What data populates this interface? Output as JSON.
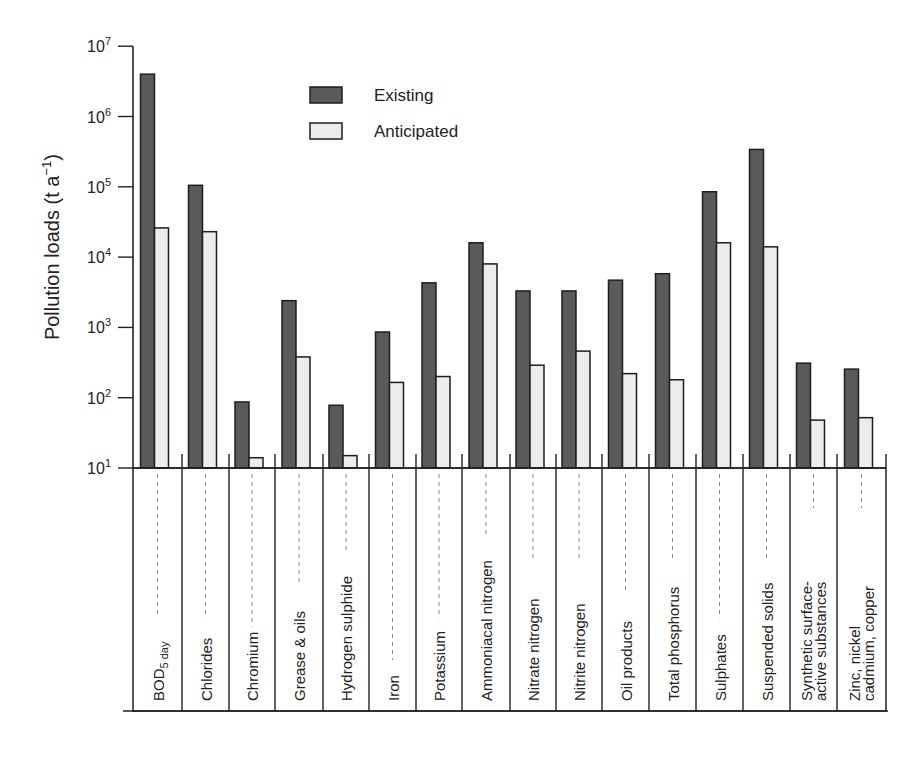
{
  "chart_data": {
    "type": "bar",
    "title": "",
    "xlabel": "",
    "ylabel": "Pollution loads  (t a⁻¹)",
    "ylabel_parts": {
      "main": "Pollution loads  (t a",
      "sup": "−1",
      "close": ")"
    },
    "yscale": "log",
    "ylim": [
      10,
      10000000
    ],
    "yticks": [
      {
        "base": "10",
        "exp": "1"
      },
      {
        "base": "10",
        "exp": "2"
      },
      {
        "base": "10",
        "exp": "3"
      },
      {
        "base": "10",
        "exp": "4"
      },
      {
        "base": "10",
        "exp": "5"
      },
      {
        "base": "10",
        "exp": "6"
      },
      {
        "base": "10",
        "exp": "7"
      }
    ],
    "grid": false,
    "legend_position": "upper-center",
    "categories": [
      [
        "BOD",
        "5 day"
      ],
      [
        "Chlorides"
      ],
      [
        "Chromium"
      ],
      [
        "Grease & oils"
      ],
      [
        "Hydrogen sulphide"
      ],
      [
        "Iron"
      ],
      [
        "Potassium"
      ],
      [
        "Ammoniacal nitrogen"
      ],
      [
        "Nitrate nitrogen"
      ],
      [
        "Nitrite nitrogen"
      ],
      [
        "Oil products"
      ],
      [
        "Total phosphorus"
      ],
      [
        "Sulphates"
      ],
      [
        "Suspended solids"
      ],
      [
        "Synthetic surface-",
        "active substances"
      ],
      [
        "Zinc, nickel",
        "cadmium, copper"
      ]
    ],
    "category_names": [
      "BOD5 day",
      "Chlorides",
      "Chromium",
      "Grease & oils",
      "Hydrogen sulphide",
      "Iron",
      "Potassium",
      "Ammoniacal nitrogen",
      "Nitrate nitrogen",
      "Nitrite nitrogen",
      "Oil products",
      "Total phosphorus",
      "Sulphates",
      "Suspended solids",
      "Synthetic surface-active substances",
      "Zinc, nickel cadmium, copper"
    ],
    "series": [
      {
        "name": "Existing",
        "color": "#5a5a5a",
        "values": [
          4000000,
          105000,
          87,
          2400,
          78,
          860,
          4300,
          16000,
          3300,
          3300,
          4700,
          5800,
          85000,
          340000,
          310,
          255
        ]
      },
      {
        "name": "Anticipated",
        "color": "#ececec",
        "values": [
          26000,
          23000,
          14,
          380,
          15,
          165,
          200,
          8000,
          290,
          460,
          220,
          180,
          16000,
          14000,
          48,
          52
        ]
      }
    ]
  },
  "legend": {
    "items": [
      {
        "label": "Existing",
        "color": "#5a5a5a"
      },
      {
        "label": "Anticipated",
        "color": "#ececec"
      }
    ]
  },
  "colors": {
    "axis": "#222222",
    "bar_outline": "#1e1e1e",
    "dashed_guide": "#8a8a8a"
  }
}
